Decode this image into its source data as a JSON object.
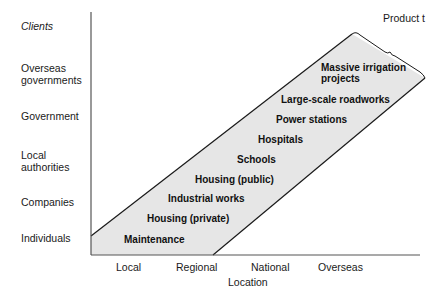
{
  "diagram": {
    "y_axis_title": "Clients",
    "x_axis_title": "Location",
    "clients": [
      "Overseas governments",
      "Government",
      "Local authorities",
      "Companies",
      "Individuals"
    ],
    "client_lines": {
      "overseas": [
        "Overseas",
        "governments"
      ],
      "local_authorities": [
        "Local",
        "authorities"
      ]
    },
    "locations": [
      "Local",
      "Regional",
      "National",
      "Overseas"
    ],
    "band_label": "Product t",
    "products": [
      "Maintenance",
      "Housing (private)",
      "Industrial works",
      "Housing (public)",
      "Schools",
      "Hospitals",
      "Power stations",
      "Large-scale roadworks",
      "Massive irrigation projects"
    ],
    "irrigation_lines": [
      "Massive irrigation",
      "projects"
    ],
    "colors": {
      "band_fill": "#e6e6e6",
      "line": "#1a1a1a",
      "axis": "#555555"
    }
  }
}
